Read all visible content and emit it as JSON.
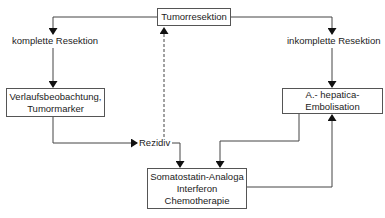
{
  "diagram": {
    "type": "flowchart",
    "nodes": {
      "top": {
        "lines": [
          "Tumorresektion"
        ]
      },
      "left": {
        "lines": [
          "Verlaufsbeobachtung,",
          "Tumormarker"
        ]
      },
      "right": {
        "lines": [
          "A.- hepatica-",
          "Embolisation"
        ]
      },
      "bottom": {
        "lines": [
          "Somatostatin-Analoga",
          "Interferon",
          "Chemotherapie"
        ]
      }
    },
    "labels": {
      "complete": "komplette Resektion",
      "incomplete": "inkomplette Resektion",
      "recurrence": "Rezidiv"
    },
    "edges": [
      {
        "from": "Tumorresektion",
        "to": "Verlaufsbeobachtung, Tumormarker",
        "label": "komplette Resektion"
      },
      {
        "from": "Tumorresektion",
        "to": "A.- hepatica-Embolisation",
        "label": "inkomplette Resektion"
      },
      {
        "from": "Verlaufsbeobachtung, Tumormarker",
        "to": "Rezidiv"
      },
      {
        "from": "Rezidiv",
        "to": "Somatostatin-Analoga Interferon Chemotherapie"
      },
      {
        "from": "Rezidiv",
        "to": "Tumorresektion",
        "style": "dashed"
      },
      {
        "from": "A.- hepatica-Embolisation",
        "to": "Somatostatin-Analoga Interferon Chemotherapie"
      },
      {
        "from": "Somatostatin-Analoga Interferon Chemotherapie",
        "to": "A.- hepatica-Embolisation"
      }
    ]
  }
}
